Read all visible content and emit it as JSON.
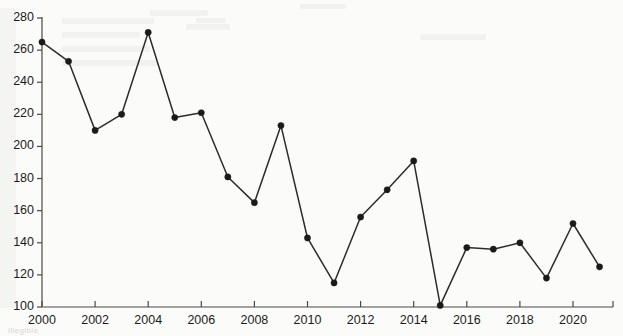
{
  "chart_data": {
    "type": "line",
    "title": "",
    "subtitle": "",
    "xlabel": "",
    "ylabel": "",
    "xlim": [
      1999.5,
      2021.9
    ],
    "ylim": [
      100,
      280
    ],
    "yticks": [
      100,
      120,
      140,
      160,
      180,
      200,
      220,
      240,
      260,
      280
    ],
    "xticks": [
      2000,
      2002,
      2004,
      2006,
      2008,
      2010,
      2012,
      2014,
      2016,
      2018,
      2020
    ],
    "xtick_labels": [
      "2000",
      "2002",
      "2004",
      "2006",
      "2008",
      "2010",
      "2012",
      "2014",
      "2016",
      "2018",
      "2020"
    ],
    "ytick_labels": [
      "100",
      "120",
      "140",
      "160",
      "180",
      "200",
      "220",
      "240",
      "260",
      "280"
    ],
    "grid": false,
    "legend": null,
    "legend_position": "none",
    "marker": "filled-circle",
    "line_color": "#2c2c2c",
    "marker_color": "#1a1a1a",
    "axis_color": "#4a4a4a",
    "background_color": "#fbfbfa",
    "x": [
      2000,
      2001,
      2002,
      2003,
      2004,
      2005,
      2006,
      2007,
      2008,
      2009,
      2010,
      2011,
      2012,
      2013,
      2014,
      2015,
      2016,
      2017,
      2018,
      2019,
      2020,
      2021
    ],
    "values": [
      265,
      253,
      210,
      220,
      271,
      218,
      221,
      181,
      165,
      213,
      143,
      115,
      156,
      173,
      191,
      101,
      137,
      136,
      140,
      118,
      152,
      125
    ],
    "series": [
      {
        "name": "",
        "values": [
          265,
          253,
          210,
          220,
          271,
          218,
          221,
          181,
          165,
          213,
          143,
          115,
          156,
          173,
          191,
          101,
          137,
          136,
          140,
          118,
          152,
          125
        ]
      }
    ],
    "annotations": []
  },
  "scan_artifacts": {
    "note": "faint illegible bleed-through text from reverse side of page",
    "bottom_strip": "illegible"
  }
}
